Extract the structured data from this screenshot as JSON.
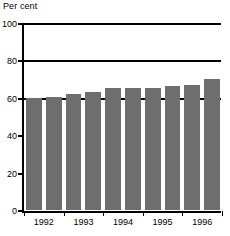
{
  "chart_data": {
    "type": "bar",
    "title": "Per cent",
    "xlabel": "",
    "ylabel": "Per cent",
    "ylim": [
      0,
      100
    ],
    "yticks": [
      0,
      20,
      40,
      60,
      80,
      100
    ],
    "ytick_labels": [
      "0",
      "20",
      "40",
      "60",
      "80",
      "100"
    ],
    "gridlines": [
      60,
      80,
      100
    ],
    "grid": true,
    "legend": "none",
    "bar_color": "#6e6e6e",
    "categories": [
      "1992 H1",
      "1992 H2",
      "1993 H1",
      "1993 H2",
      "1994 H1",
      "1994 H2",
      "1995 H1",
      "1995 H2",
      "1996 H1",
      "1996 H2"
    ],
    "values": [
      60,
      60.5,
      62,
      63,
      65,
      65,
      65.5,
      66.5,
      67,
      70
    ],
    "x_tick_labels": [
      "1992",
      "1993",
      "1994",
      "1995",
      "1996"
    ],
    "x_tick_positions": [
      1,
      3,
      5,
      7,
      9
    ]
  }
}
